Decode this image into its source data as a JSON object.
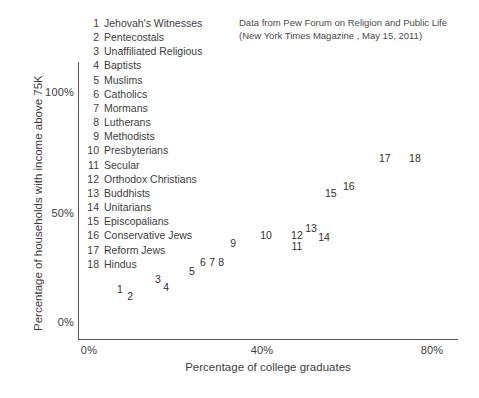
{
  "chart_data": {
    "type": "scatter",
    "title": "",
    "subtitle": "",
    "xlabel": "Percentage of college graduates",
    "ylabel": "Percentage of households with income above 75K",
    "xlim": [
      0,
      88
    ],
    "ylim": [
      0,
      115
    ],
    "xticks": [
      "0%",
      "40%",
      "80%"
    ],
    "xtick_values": [
      0,
      40,
      80
    ],
    "yticks": [
      "0%",
      "50%",
      "100%"
    ],
    "ytick_values": [
      0,
      50,
      100
    ],
    "grid": false,
    "legend_position": "upper-left-inside",
    "point_label_style": "numeric-index",
    "annotations": [
      "Data from Pew Forum on Religion and Public Life",
      "(New York Times Magazine , May 15, 2011)"
    ],
    "points": [
      {
        "id": "1",
        "name": "Jehovah's Witnesses",
        "x": 7.2,
        "y": 14.3
      },
      {
        "id": "2",
        "name": "Pentecostals",
        "x": 9.6,
        "y": 11.3
      },
      {
        "id": "3",
        "name": "Unaffiliated Religious",
        "x": 16.1,
        "y": 18.7
      },
      {
        "id": "4",
        "name": "Baptists",
        "x": 18.0,
        "y": 15.2
      },
      {
        "id": "5",
        "name": "Muslims",
        "x": 24.0,
        "y": 22.2
      },
      {
        "id": "6",
        "name": "Catholics",
        "x": 26.6,
        "y": 26.1
      },
      {
        "id": "7",
        "name": "Mormans",
        "x": 28.7,
        "y": 26.1
      },
      {
        "id": "8",
        "name": "Lutherans",
        "x": 30.8,
        "y": 26.1
      },
      {
        "id": "9",
        "name": "Methodists",
        "x": 33.6,
        "y": 34.3
      },
      {
        "id": "10",
        "name": "Presbyterians",
        "x": 41.3,
        "y": 37.8
      },
      {
        "id": "11",
        "name": "Secular",
        "x": 48.5,
        "y": 33.0
      },
      {
        "id": "12",
        "name": "Orthodox Christians",
        "x": 48.5,
        "y": 37.8
      },
      {
        "id": "13",
        "name": "Buddhists",
        "x": 51.8,
        "y": 40.9
      },
      {
        "id": "14",
        "name": "Unitarians",
        "x": 54.8,
        "y": 37.0
      },
      {
        "id": "15",
        "name": "Episcopalians",
        "x": 56.4,
        "y": 56.1
      },
      {
        "id": "16",
        "name": "Conservative Jews",
        "x": 60.6,
        "y": 59.1
      },
      {
        "id": "17",
        "name": "Reform Jews",
        "x": 69.0,
        "y": 71.3
      },
      {
        "id": "18",
        "name": "Hindus",
        "x": 76.0,
        "y": 71.3
      }
    ]
  },
  "legend": {
    "items": [
      {
        "num": "1",
        "label": "Jehovah's Witnesses"
      },
      {
        "num": "2",
        "label": "Pentecostals"
      },
      {
        "num": "3",
        "label": "Unaffiliated Religious"
      },
      {
        "num": "4",
        "label": "Baptists"
      },
      {
        "num": "5",
        "label": "Muslims"
      },
      {
        "num": "6",
        "label": "Catholics"
      },
      {
        "num": "7",
        "label": "Mormans"
      },
      {
        "num": "8",
        "label": "Lutherans"
      },
      {
        "num": "9",
        "label": "Methodists"
      },
      {
        "num": "10",
        "label": "Presbyterians"
      },
      {
        "num": "11",
        "label": "Secular"
      },
      {
        "num": "12",
        "label": "Orthodox Christians"
      },
      {
        "num": "13",
        "label": "Buddhists"
      },
      {
        "num": "14",
        "label": "Unitarians"
      },
      {
        "num": "15",
        "label": "Episcopalians"
      },
      {
        "num": "16",
        "label": "Conservative Jews"
      },
      {
        "num": "17",
        "label": "Reform Jews"
      },
      {
        "num": "18",
        "label": "Hindus"
      }
    ]
  },
  "source_note": {
    "line1": "Data from Pew Forum on Religion and Public Life",
    "line2": "(New York Times Magazine , May 15, 2011)"
  },
  "colors": {
    "axis": "#555555",
    "text": "#3d3d3d",
    "point_text": "#2f2f2f",
    "background": "#ffffff"
  }
}
